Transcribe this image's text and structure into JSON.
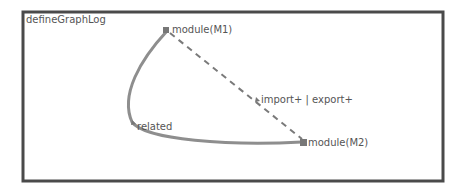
{
  "diagram": {
    "title": "defineGraphLog",
    "nodes": [
      {
        "id": "M1",
        "label": "module(M1)",
        "x": 167,
        "y": 30
      },
      {
        "id": "M2",
        "label": "module(M2)",
        "x": 304,
        "y": 143
      },
      {
        "id": "related",
        "label": "related",
        "x": 134,
        "y": 122
      }
    ],
    "edges": [
      {
        "from": "M1",
        "to": "M2",
        "style": "dashed",
        "label": "import+ | export+"
      },
      {
        "from": "M1",
        "to": "M2",
        "style": "solid-curve",
        "via": "related",
        "label": "related"
      }
    ],
    "colors": {
      "frame": "#4a4a4a",
      "edge": "#8a8a8a",
      "text": "#555555"
    }
  }
}
